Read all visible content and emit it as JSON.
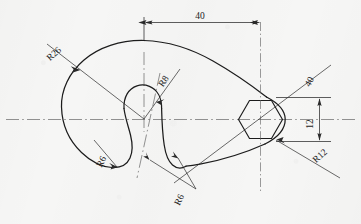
{
  "drawing": {
    "title": "Hook plate with hexagonal socket",
    "type": "orthographic-outline",
    "background_color": "#f6f6f5",
    "line_color": "#1c1c1c",
    "centerline_color": "#555555",
    "dimension_color": "#333333"
  },
  "dimensions": {
    "width_overall": {
      "label": "40",
      "kind": "linear-horizontal"
    },
    "hex_across": {
      "label": "12",
      "kind": "linear-vertical"
    },
    "angle_leader": {
      "label": "40",
      "kind": "leader-linear"
    },
    "radius_big": {
      "label": "R26",
      "kind": "radius"
    },
    "radius_notch": {
      "label": "R8",
      "kind": "radius"
    },
    "radius_hook_bottom": {
      "label": "R6",
      "kind": "radius"
    },
    "radius_tail": {
      "label": "R6",
      "kind": "radius"
    },
    "radius_end": {
      "label": "R12",
      "kind": "radius"
    }
  },
  "labels": [
    {
      "id": "dim-40-top",
      "text": "40",
      "x": 200,
      "y": 19,
      "rotate": 0,
      "size": 9
    },
    {
      "id": "dim-r26",
      "text": "R26",
      "x": 56,
      "y": 56,
      "rotate": -42,
      "size": 9
    },
    {
      "id": "dim-r8",
      "text": "R8",
      "x": 166,
      "y": 83,
      "rotate": -56,
      "size": 9
    },
    {
      "id": "dim-r6-lower-left",
      "text": "R6",
      "x": 104,
      "y": 163,
      "rotate": -62,
      "size": 9
    },
    {
      "id": "dim-r6-bottom",
      "text": "R6",
      "x": 182,
      "y": 201,
      "rotate": -64,
      "size": 9
    },
    {
      "id": "dim-40-leader",
      "text": "40",
      "x": 312,
      "y": 83,
      "rotate": -62,
      "size": 9
    },
    {
      "id": "dim-12",
      "text": "12",
      "x": 313,
      "y": 124,
      "rotate": -90,
      "size": 9
    },
    {
      "id": "dim-r12",
      "text": "R12",
      "x": 322,
      "y": 158,
      "rotate": -42,
      "size": 9
    }
  ]
}
